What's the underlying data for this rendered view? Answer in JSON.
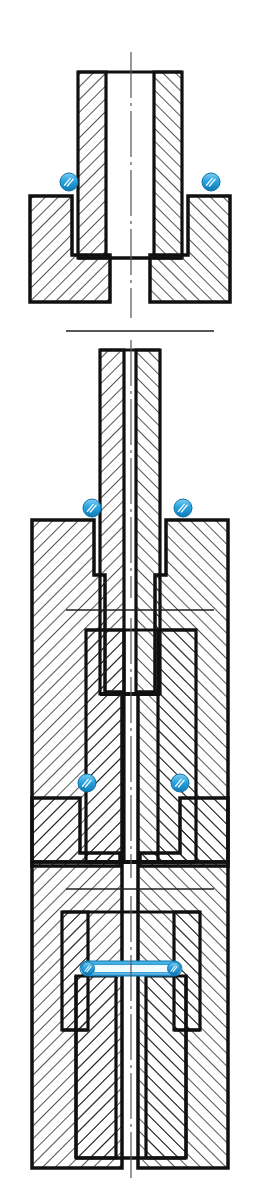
{
  "document": {
    "title": "Sealing arrangements — cross-sections",
    "subject": "Tube-to-body joint seal variants",
    "drawing_type": "engineering cross-section",
    "panel_count": 4,
    "background_color": "#ffffff",
    "line_color": "#101010",
    "hatch_color": "#1a1a1a",
    "seal_color": "#2aa3e0",
    "seal_color_dark": "#0d72ab",
    "seal_color_light": "#a8ddf5",
    "centerline_color": "#555555",
    "separator_color": "#1f1f1f"
  },
  "chart_data": {
    "type": "diagram",
    "panels": [
      {
        "id": "panel-1",
        "index": 1,
        "label": "Face-seal at shoulder",
        "seal_type": "o-ring",
        "seal_count": 2,
        "seal_positions": [
          [
            69,
            182
          ],
          [
            211,
            182
          ]
        ],
        "seal_radius": 9,
        "description": "Tube with thick walls seated into a counterbored body; O-rings compressed at the outer shoulder corners."
      },
      {
        "id": "panel-2",
        "index": 2,
        "label": "Radial seal in corner groove — slim tube",
        "seal_type": "o-ring",
        "seal_count": 2,
        "seal_positions": [
          [
            92,
            508
          ],
          [
            183,
            508
          ]
        ],
        "seal_radius": 10,
        "description": "Slim tube inserted into a deep bore; O-rings trapped in the corner relief of the body."
      },
      {
        "id": "panel-3",
        "index": 3,
        "label": "Radial seal in corner groove — wide tube",
        "seal_type": "o-ring",
        "seal_count": 2,
        "seal_positions": [
          [
            87,
            783
          ],
          [
            180,
            783
          ]
        ],
        "seal_radius": 10,
        "description": "Wide-wall tube inserted into a shallow bore; O-rings trapped in the corner relief of the body."
      },
      {
        "id": "panel-4",
        "index": 4,
        "label": "Flat gasket on bore face",
        "seal_type": "flat-gasket",
        "seal_count": 1,
        "seal_positions": [
          [
            131,
            968
          ]
        ],
        "gasket_span_x": [
          88,
          178
        ],
        "gasket_height": 13,
        "description": "Inner member bottoms out inside an outer socket; a flat annular gasket seals the horizontal landing face."
      }
    ],
    "separators": [
      {
        "id": "separator-1",
        "y": 331,
        "x1": 66,
        "x2": 214
      },
      {
        "id": "separator-2",
        "y": 610,
        "x1": 66,
        "x2": 214
      },
      {
        "id": "separator-3",
        "y": 889,
        "x1": 66,
        "x2": 214
      }
    ],
    "axis": {
      "name": "centerline",
      "style": "dash-dot",
      "x": 131,
      "segments": [
        [
          52,
          318
        ],
        [
          340,
          598
        ],
        [
          618,
          878
        ],
        [
          896,
          1178
        ]
      ]
    }
  }
}
